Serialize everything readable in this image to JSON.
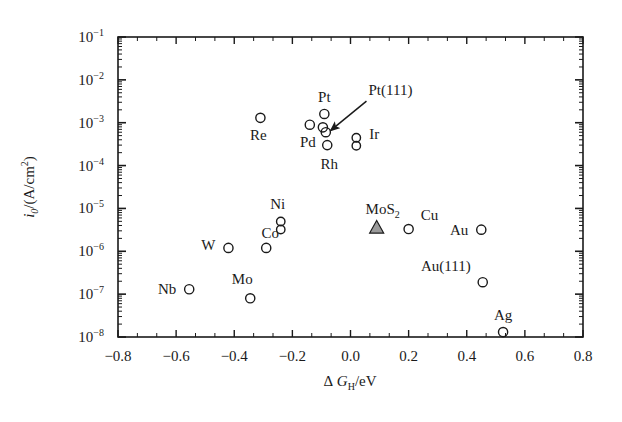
{
  "chart_data": {
    "type": "scatter",
    "title": "",
    "xlabel": "ΔG_H/eV",
    "ylabel": "i_0/(A/cm²)",
    "xlabel_parts": {
      "delta": "Δ",
      "g": "G",
      "sub": "H",
      "rest": "/eV"
    },
    "ylabel_parts": {
      "i": "i",
      "sub": "0",
      "rest": "/(A/cm",
      "sup": "2",
      "close": ")"
    },
    "xlim": [
      -0.8,
      0.8
    ],
    "ylim": [
      1e-08,
      0.1
    ],
    "yscale": "log",
    "xticks": [
      -0.8,
      -0.6,
      -0.4,
      -0.2,
      0.0,
      0.2,
      0.4,
      0.6,
      0.8
    ],
    "xtick_labels": [
      "-0.8",
      "-0.6",
      "-0.4",
      "-0.2",
      "0.0",
      "0.2",
      "0.4",
      "0.6",
      "0.8"
    ],
    "yticks": [
      -1,
      -2,
      -3,
      -4,
      -5,
      -6,
      -7,
      -8
    ],
    "ytick_labels": [
      "10",
      "10",
      "10",
      "10",
      "10",
      "10",
      "10",
      "10"
    ],
    "ytick_exponents": [
      "-1",
      "-2",
      "-3",
      "-4",
      "-5",
      "-6",
      "-7",
      "-8"
    ],
    "grid": false,
    "legend": "none",
    "minor_ticks": "log-decade minor ticks on both y sides; 2 minor x ticks per major interval; ticks inward on all four frame sides",
    "points": [
      {
        "name": "Re",
        "x": -0.31,
        "y": 0.0013,
        "marker": "circle",
        "label_dx": -2,
        "label_dy": 22,
        "label_anchor": "middle"
      },
      {
        "name": "Pd",
        "x": -0.14,
        "y": 0.0009,
        "marker": "circle",
        "label_dx": -2,
        "label_dy": 22,
        "label_anchor": "middle"
      },
      {
        "name": "Pt",
        "x": -0.09,
        "y": 0.0016,
        "marker": "circle",
        "label_dx": 0,
        "label_dy": -12,
        "label_anchor": "middle"
      },
      {
        "name": "Rh",
        "x": -0.08,
        "y": 0.0003,
        "marker": "circle",
        "label_dx": 2,
        "label_dy": 24,
        "label_anchor": "middle"
      },
      {
        "name": "Pt(111)",
        "x": -0.085,
        "y": 0.0006,
        "marker": "circle",
        "label_dx": 0,
        "label_dy": 0,
        "label_anchor": "start",
        "callout": true
      },
      {
        "name": "",
        "x": -0.095,
        "y": 0.00078,
        "marker": "circle",
        "label_dx": 0,
        "label_dy": 0,
        "label_anchor": "middle"
      },
      {
        "name": "Ir",
        "x": 0.02,
        "y": 0.00036,
        "marker": "double-circle",
        "label_dx": 13,
        "label_dy": -3,
        "label_anchor": "start"
      },
      {
        "name": "MoS₂",
        "x": 0.09,
        "y": 3.6e-06,
        "marker": "triangle",
        "label_dx": 6,
        "label_dy": -13,
        "label_anchor": "middle"
      },
      {
        "name": "Ni",
        "x": -0.24,
        "y": 4e-06,
        "marker": "double-circle",
        "label_dx": -3,
        "label_dy": -16,
        "label_anchor": "middle"
      },
      {
        "name": "Co",
        "x": -0.29,
        "y": 1.2e-06,
        "marker": "circle",
        "label_dx": 4,
        "label_dy": -10,
        "label_anchor": "middle"
      },
      {
        "name": "W",
        "x": -0.42,
        "y": 1.2e-06,
        "marker": "circle",
        "label_dx": -20,
        "label_dy": 2,
        "label_anchor": "middle"
      },
      {
        "name": "Mo",
        "x": -0.345,
        "y": 8e-08,
        "marker": "circle",
        "label_dx": -8,
        "label_dy": -14,
        "label_anchor": "middle"
      },
      {
        "name": "Nb",
        "x": -0.555,
        "y": 1.3e-07,
        "marker": "circle",
        "label_dx": -22,
        "label_dy": 5,
        "label_anchor": "middle"
      },
      {
        "name": "Cu",
        "x": 0.2,
        "y": 3.3e-06,
        "marker": "circle",
        "label_dx": 12,
        "label_dy": -9,
        "label_anchor": "start"
      },
      {
        "name": "Au",
        "x": 0.45,
        "y": 3.2e-06,
        "marker": "circle",
        "label_dx": -13,
        "label_dy": 5,
        "label_anchor": "end"
      },
      {
        "name": "Au(111)",
        "x": 0.455,
        "y": 1.9e-07,
        "marker": "circle",
        "label_dx": -12,
        "label_dy": -11,
        "label_anchor": "end"
      },
      {
        "name": "Ag",
        "x": 0.525,
        "y": 1.3e-08,
        "marker": "circle",
        "label_dx": 0,
        "label_dy": -12,
        "label_anchor": "middle"
      }
    ],
    "annotations": [
      {
        "text": "Pt(111)",
        "type": "arrow-callout",
        "from": [
          0.055,
          0.0032
        ],
        "to": [
          -0.068,
          0.00066
        ]
      }
    ],
    "colors": {
      "axis": "#1a1a1a",
      "marker_stroke": "#1a1a1a",
      "marker_fill": "none",
      "triangle_fill": "#9a9a9a",
      "text": "#1a1a1a",
      "background": "#ffffff"
    }
  }
}
